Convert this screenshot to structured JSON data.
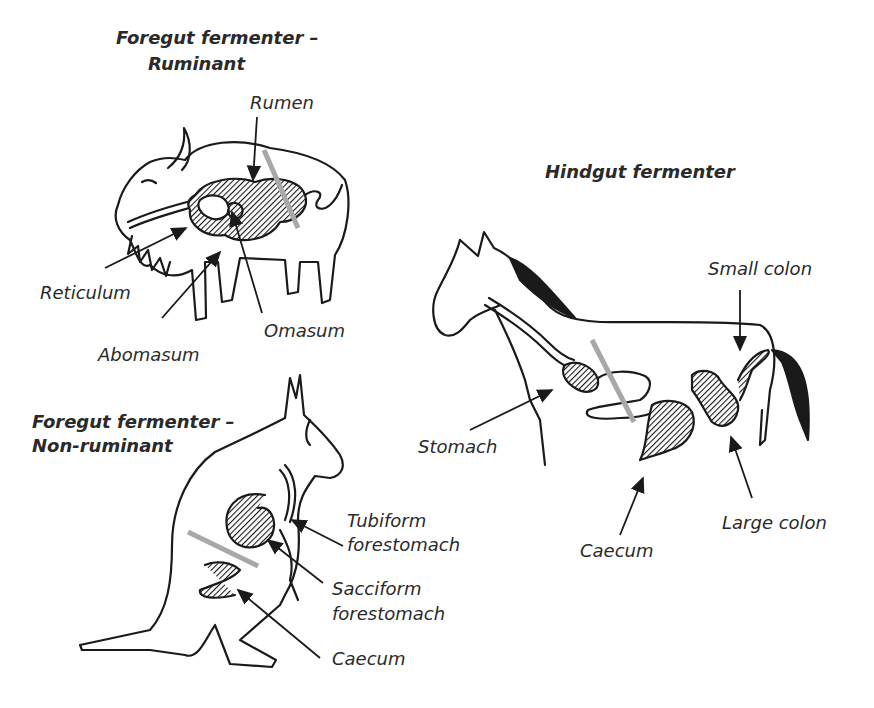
{
  "panels": {
    "ruminant": {
      "title_line1": "Foregut fermenter –",
      "title_line2": "Ruminant",
      "labels": {
        "rumen": "Rumen",
        "reticulum": "Reticulum",
        "abomasum": "Abomasum",
        "omasum": "Omasum"
      }
    },
    "non_ruminant": {
      "title_line1": "Foregut fermenter –",
      "title_line2": "Non-ruminant",
      "labels": {
        "tubiform_1": "Tubiform",
        "tubiform_2": "forestomach",
        "sacciform_1": "Sacciform",
        "sacciform_2": "forestomach",
        "caecum": "Caecum"
      }
    },
    "hindgut": {
      "title": "Hindgut fermenter",
      "labels": {
        "small_colon": "Small colon",
        "stomach": "Stomach",
        "caecum": "Caecum",
        "large_colon": "Large colon"
      }
    }
  },
  "colors": {
    "ink": "#1a1a1a",
    "divider_bar": "#a8a8a8"
  }
}
